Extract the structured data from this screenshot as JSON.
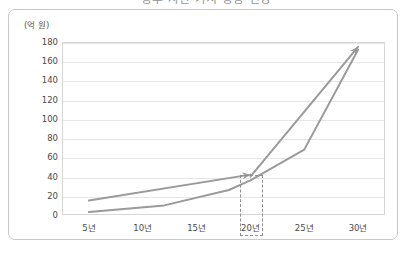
{
  "title": "향후 자산 가치 상승 전망",
  "frame": {
    "border_color": "#c9c9c9"
  },
  "chart_data": {
    "type": "line",
    "title": "향후 자산 가치 상승 전망",
    "xlabel": "",
    "ylabel": "",
    "yunit": "(억 원)",
    "ylim": [
      0,
      180
    ],
    "ytick_step": 20,
    "yticks": [
      "180",
      "160",
      "140",
      "120",
      "100",
      "80",
      "60",
      "40",
      "20",
      "0"
    ],
    "ytick_values": [
      180,
      160,
      140,
      120,
      100,
      80,
      60,
      40,
      20,
      0
    ],
    "categories": [
      "5년",
      "10년",
      "15년",
      "20년",
      "25년",
      "30년"
    ],
    "x_values": [
      5,
      10,
      15,
      20,
      25,
      30
    ],
    "grid": true,
    "legend": "none",
    "line_color": "#9a9a9a",
    "series": [
      {
        "name": "1구간 추세선",
        "arrow": true,
        "points": [
          [
            5,
            15
          ],
          [
            20,
            42
          ]
        ]
      },
      {
        "name": "2구간 급상승 추세선",
        "arrow": true,
        "points": [
          [
            20,
            40
          ],
          [
            30,
            175
          ]
        ]
      },
      {
        "name": "기준 성장 곡선",
        "arrow": false,
        "points": [
          [
            5,
            3
          ],
          [
            12,
            10
          ],
          [
            18,
            26
          ],
          [
            20,
            36
          ],
          [
            25,
            68
          ],
          [
            30,
            172
          ]
        ]
      }
    ],
    "annotations": [
      {
        "name": "20년 강조 박스",
        "style": "dashed-rect",
        "x_label": "20년",
        "x_from": 19.0,
        "x_to": 21.2,
        "y_top": 42,
        "y_bottom": -22
      }
    ]
  }
}
